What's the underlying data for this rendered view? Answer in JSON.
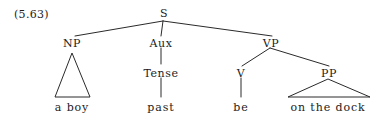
{
  "figure": {
    "example_number": "(5.63)",
    "sentence": "a boy past be on the dock",
    "width": 384,
    "height": 122,
    "background_color": "#ffffff",
    "line_color": "#2a2a2a",
    "text_color": "#1c1c1c"
  },
  "tree": {
    "root_label": "S",
    "nodes": {
      "s": "S",
      "np": "NP",
      "aux": "Aux",
      "vp": "VP",
      "tense": "Tense",
      "v": "V",
      "pp": "PP"
    },
    "leaves": {
      "np_leaf": "a boy",
      "tense_leaf": "past",
      "v_leaf": "be",
      "pp_leaf": "on the dock"
    }
  }
}
